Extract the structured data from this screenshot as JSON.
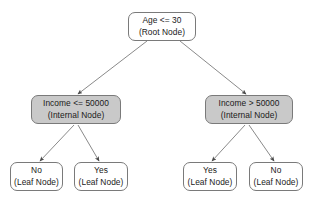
{
  "diagram": {
    "type": "decision-tree",
    "title": "",
    "background_color": "#ffffff",
    "edge_color": "#808080",
    "node_border_color": "#7a7a7a",
    "internal_fill_color": "#c9c9c9",
    "leaf_fill_color": "#ffffff",
    "root": {
      "id": "root",
      "condition": "Age <= 30",
      "role": "(Root Node)"
    },
    "internal_nodes": [
      {
        "id": "internal-left",
        "condition": "Income <= 50000",
        "role": "(Internal Node)"
      },
      {
        "id": "internal-right",
        "condition": "Income > 50000",
        "role": "(Internal Node)"
      }
    ],
    "leaf_nodes": [
      {
        "id": "leaf-left-1",
        "label": "No",
        "role": "(Leaf Node)"
      },
      {
        "id": "leaf-left-2",
        "label": "Yes",
        "role": "(Leaf Node)"
      },
      {
        "id": "leaf-right-1",
        "label": "Yes",
        "role": "(Leaf Node)"
      },
      {
        "id": "leaf-right-2",
        "label": "No",
        "role": "(Leaf Node)"
      }
    ]
  }
}
